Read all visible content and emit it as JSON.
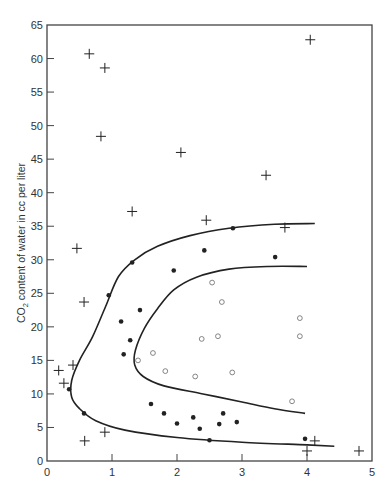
{
  "chart_data": {
    "type": "scatter",
    "title": "",
    "xlabel": "",
    "ylabel": "CO2 content of water in cc per liter",
    "ylabel_parts": {
      "pre": "CO",
      "sub": "2",
      "post": " content of water in cc per liter"
    },
    "xlim": [
      0,
      5
    ],
    "ylim": [
      0,
      65
    ],
    "x_ticks": [
      0,
      1,
      2,
      3,
      4,
      5
    ],
    "y_ticks": [
      0,
      5,
      10,
      15,
      20,
      25,
      30,
      35,
      40,
      45,
      50,
      55,
      60,
      65
    ],
    "grid": false,
    "legend": null,
    "series": [
      {
        "name": "crosses",
        "marker": "plus",
        "points": [
          [
            0.65,
            60.7
          ],
          [
            0.89,
            58.6
          ],
          [
            0.83,
            48.4
          ],
          [
            2.06,
            46.0
          ],
          [
            4.05,
            62.8
          ],
          [
            3.37,
            42.6
          ],
          [
            1.31,
            37.2
          ],
          [
            2.45,
            35.9
          ],
          [
            3.66,
            34.8
          ],
          [
            0.46,
            31.7
          ],
          [
            0.57,
            23.7
          ],
          [
            0.4,
            14.3
          ],
          [
            0.18,
            13.5
          ],
          [
            0.26,
            11.6
          ],
          [
            0.89,
            4.3
          ],
          [
            0.58,
            3.0
          ],
          [
            4.12,
            3.0
          ],
          [
            4.0,
            1.5
          ],
          [
            4.8,
            1.5
          ]
        ]
      },
      {
        "name": "filled circles",
        "marker": "dot",
        "points": [
          [
            1.31,
            29.6
          ],
          [
            2.86,
            34.7
          ],
          [
            2.42,
            31.4
          ],
          [
            1.95,
            28.4
          ],
          [
            3.51,
            30.4
          ],
          [
            0.95,
            24.7
          ],
          [
            1.43,
            22.5
          ],
          [
            1.14,
            20.8
          ],
          [
            1.28,
            18.0
          ],
          [
            1.18,
            15.9
          ],
          [
            0.34,
            10.7
          ],
          [
            0.57,
            7.1
          ],
          [
            1.6,
            8.5
          ],
          [
            1.8,
            7.1
          ],
          [
            2.0,
            5.6
          ],
          [
            2.25,
            6.5
          ],
          [
            2.35,
            4.8
          ],
          [
            2.5,
            3.1
          ],
          [
            2.65,
            5.5
          ],
          [
            2.71,
            7.1
          ],
          [
            2.92,
            5.8
          ],
          [
            3.97,
            3.3
          ]
        ]
      },
      {
        "name": "open circles",
        "marker": "circle",
        "points": [
          [
            2.54,
            26.6
          ],
          [
            2.69,
            23.7
          ],
          [
            3.89,
            21.3
          ],
          [
            2.38,
            18.2
          ],
          [
            2.63,
            18.6
          ],
          [
            3.89,
            18.6
          ],
          [
            1.4,
            15.0
          ],
          [
            1.63,
            16.1
          ],
          [
            1.82,
            13.4
          ],
          [
            2.28,
            12.6
          ],
          [
            2.85,
            13.2
          ],
          [
            3.77,
            8.9
          ]
        ]
      }
    ],
    "curves": [
      {
        "name": "outer boundary",
        "points": [
          [
            4.12,
            35.4
          ],
          [
            3.5,
            35.3
          ],
          [
            2.8,
            34.7
          ],
          [
            2.2,
            33.6
          ],
          [
            1.7,
            32.0
          ],
          [
            1.35,
            30.0
          ],
          [
            1.1,
            27.5
          ],
          [
            0.9,
            23.0
          ],
          [
            0.7,
            18.5
          ],
          [
            0.5,
            15.0
          ],
          [
            0.38,
            12.0
          ],
          [
            0.38,
            9.5
          ],
          [
            0.5,
            7.8
          ],
          [
            0.75,
            6.0
          ],
          [
            1.2,
            4.6
          ],
          [
            2.0,
            3.5
          ],
          [
            3.0,
            2.8
          ],
          [
            4.0,
            2.4
          ],
          [
            4.42,
            2.2
          ]
        ]
      },
      {
        "name": "inner boundary",
        "points": [
          [
            4.0,
            29.0
          ],
          [
            3.4,
            29.0
          ],
          [
            2.8,
            28.6
          ],
          [
            2.3,
            27.4
          ],
          [
            1.95,
            25.5
          ],
          [
            1.7,
            22.7
          ],
          [
            1.5,
            19.8
          ],
          [
            1.36,
            16.5
          ],
          [
            1.35,
            14.3
          ],
          [
            1.48,
            12.6
          ],
          [
            1.8,
            11.2
          ],
          [
            2.4,
            10.0
          ],
          [
            3.0,
            8.8
          ],
          [
            3.5,
            7.8
          ],
          [
            3.97,
            7.1
          ]
        ]
      }
    ]
  },
  "axes": {
    "x_tick_labels": [
      "0",
      "1",
      "2",
      "3",
      "4",
      "5"
    ],
    "y_tick_labels": [
      "0",
      "5",
      "10",
      "15",
      "20",
      "25",
      "30",
      "35",
      "40",
      "45",
      "50",
      "55",
      "60",
      "65"
    ]
  },
  "colors": {
    "ink": "#222222",
    "open_marker": "#777777",
    "frame": "#444444"
  }
}
